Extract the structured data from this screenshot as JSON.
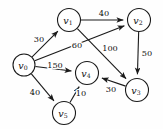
{
  "figure": {
    "kind": "weighted-directed-graph",
    "background_color": "#fefefe",
    "stroke_color": "#1a1a1a",
    "text_color": "#111111"
  },
  "graph": {
    "nodes": [
      {
        "id": "v0",
        "base": "v",
        "sub": "0",
        "cx": 24,
        "cy": 65,
        "r": 11
      },
      {
        "id": "v1",
        "base": "v",
        "sub": "1",
        "cx": 69,
        "cy": 20,
        "r": 11.5
      },
      {
        "id": "v2",
        "base": "v",
        "sub": "2",
        "cx": 139,
        "cy": 20,
        "r": 11.5
      },
      {
        "id": "v3",
        "base": "v",
        "sub": "3",
        "cx": 137,
        "cy": 90,
        "r": 11.5
      },
      {
        "id": "v4",
        "base": "v",
        "sub": "4",
        "cx": 87,
        "cy": 73,
        "r": 11.5
      },
      {
        "id": "v5",
        "base": "v",
        "sub": "5",
        "cx": 64,
        "cy": 113,
        "r": 11.5
      }
    ],
    "edges": [
      {
        "id": "e-v0-v1",
        "from": "v0",
        "to": "v1",
        "weight": "30",
        "lx": 39,
        "ly": 39
      },
      {
        "id": "e-v1-v2",
        "from": "v1",
        "to": "v2",
        "weight": "40",
        "lx": 104,
        "ly": 13
      },
      {
        "id": "e-v0-v2",
        "from": "v0",
        "to": "v2",
        "weight": "60",
        "lx": 77,
        "ly": 45
      },
      {
        "id": "e-v1-v3",
        "from": "v1",
        "to": "v3",
        "weight": "100",
        "lx": 110,
        "ly": 48
      },
      {
        "id": "e-v2-v3",
        "from": "v2",
        "to": "v3",
        "weight": "50",
        "lx": 147,
        "ly": 53
      },
      {
        "id": "e-v0-v4",
        "from": "v0",
        "to": "v4",
        "weight": "150",
        "lx": 55,
        "ly": 65
      },
      {
        "id": "e-v3-v4",
        "from": "v3",
        "to": "v4",
        "weight": "30",
        "lx": 111,
        "ly": 89
      },
      {
        "id": "e-v0-v5",
        "from": "v0",
        "to": "v5",
        "weight": "40",
        "lx": 35,
        "ly": 92
      },
      {
        "id": "e-v5-v4",
        "from": "v5",
        "to": "v4",
        "weight": "10",
        "lx": 81,
        "ly": 93
      }
    ]
  }
}
